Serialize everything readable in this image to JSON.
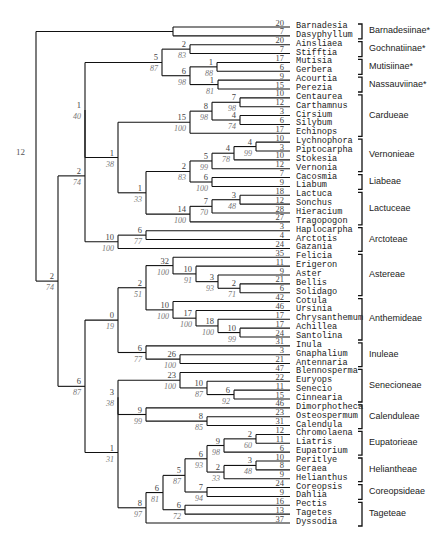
{
  "diagram": {
    "type": "cladogram",
    "root_label": "12",
    "leaves": [
      {
        "name": "Barnadesia",
        "len": "20"
      },
      {
        "name": "Dasyphyllum",
        "len": "7"
      },
      {
        "name": "Ainsliaea",
        "len": "20"
      },
      {
        "name": "Stifftia",
        "len": "7"
      },
      {
        "name": "Mutisia",
        "len": "17"
      },
      {
        "name": "Gerbera",
        "len": "6"
      },
      {
        "name": "Acourtia",
        "len": "9"
      },
      {
        "name": "Perezia",
        "len": "15"
      },
      {
        "name": "Centaurea",
        "len": "10"
      },
      {
        "name": "Carthamnus",
        "len": "12"
      },
      {
        "name": "Cirsium",
        "len": "3"
      },
      {
        "name": "Silybum",
        "len": "6"
      },
      {
        "name": "Echinops",
        "len": "17"
      },
      {
        "name": "Lychnophora",
        "len": "10"
      },
      {
        "name": "Piptocarpha",
        "len": "3"
      },
      {
        "name": "Stokesia",
        "len": "10"
      },
      {
        "name": "Vernonia",
        "len": "12"
      },
      {
        "name": "Cacosmia",
        "len": "7"
      },
      {
        "name": "Liabum",
        "len": "9"
      },
      {
        "name": "Lactuca",
        "len": "18"
      },
      {
        "name": "Sonchus",
        "len": "12"
      },
      {
        "name": "Hieracium",
        "len": "28"
      },
      {
        "name": "Tragopogon",
        "len": "27"
      },
      {
        "name": "Haplocarpha",
        "len": "3"
      },
      {
        "name": "Arctotis",
        "len": "4"
      },
      {
        "name": "Gazania",
        "len": "24"
      },
      {
        "name": "Felicia",
        "len": "35"
      },
      {
        "name": "Erigeron",
        "len": "11"
      },
      {
        "name": "Aster",
        "len": "9"
      },
      {
        "name": "Bellis",
        "len": "21"
      },
      {
        "name": "Solidago",
        "len": "6"
      },
      {
        "name": "Cotula",
        "len": "42"
      },
      {
        "name": "Ursinia",
        "len": "46"
      },
      {
        "name": "Chrysanthemum",
        "len": "17"
      },
      {
        "name": "Achillea",
        "len": "17"
      },
      {
        "name": "Santolina",
        "len": "24"
      },
      {
        "name": "Inula",
        "len": "31"
      },
      {
        "name": "Gnaphalium",
        "len": "3"
      },
      {
        "name": "Antennaria",
        "len": "21"
      },
      {
        "name": "Blennosperma",
        "len": "47"
      },
      {
        "name": "Euryops",
        "len": "22"
      },
      {
        "name": "Senecio",
        "len": "11"
      },
      {
        "name": "Cinnearia",
        "len": "15"
      },
      {
        "name": "Dimorphotheca",
        "len": "46"
      },
      {
        "name": "Osteospermum",
        "len": "23"
      },
      {
        "name": "Calendula",
        "len": "31"
      },
      {
        "name": "Chromolaena",
        "len": "12"
      },
      {
        "name": "Liatris",
        "len": "11"
      },
      {
        "name": "Eupatorium",
        "len": "6"
      },
      {
        "name": "Peritlye",
        "len": "10"
      },
      {
        "name": "Geraea",
        "len": "8"
      },
      {
        "name": "Helianthus",
        "len": "9"
      },
      {
        "name": "Coreopsis",
        "len": "24"
      },
      {
        "name": "Dahlia",
        "len": "9"
      },
      {
        "name": "Pectis",
        "len": "16"
      },
      {
        "name": "Tagetes",
        "len": "13"
      },
      {
        "name": "Dyssodia",
        "len": "37"
      }
    ],
    "tribes": [
      {
        "label": "Barnadesiinae*",
        "from": 0,
        "to": 1
      },
      {
        "label": "Gochnatiinae*",
        "from": 2,
        "to": 3
      },
      {
        "label": "Mutisiinae*",
        "from": 4,
        "to": 5
      },
      {
        "label": "Nassauviinae*",
        "from": 6,
        "to": 7
      },
      {
        "label": "Cardueae",
        "from": 8,
        "to": 12
      },
      {
        "label": "Vernonieae",
        "from": 13,
        "to": 16
      },
      {
        "label": "Liabeae",
        "from": 17,
        "to": 18
      },
      {
        "label": "Lactuceae",
        "from": 19,
        "to": 22
      },
      {
        "label": "Arctoteae",
        "from": 23,
        "to": 25
      },
      {
        "label": "Astereae",
        "from": 26,
        "to": 30
      },
      {
        "label": "Anthemideae",
        "from": 31,
        "to": 35
      },
      {
        "label": "Inuleae",
        "from": 36,
        "to": 38
      },
      {
        "label": "Senecioneae",
        "from": 39,
        "to": 42
      },
      {
        "label": "Calenduleae",
        "from": 43,
        "to": 45
      },
      {
        "label": "Eupatorieae",
        "from": 46,
        "to": 48
      },
      {
        "label": "Heliantheae",
        "from": 49,
        "to": 51
      },
      {
        "label": "Coreopsideae",
        "from": 52,
        "to": 53
      },
      {
        "label": "Tageteae",
        "from": 54,
        "to": 56
      }
    ],
    "nodes": [
      {
        "x": 173,
        "y": 31,
        "kids": [
          "L0",
          "L1"
        ]
      },
      {
        "x": 190,
        "y": 50,
        "kids": [
          "L2",
          "L3"
        ],
        "len": "2",
        "boot": "83"
      },
      {
        "x": 217,
        "y": 69,
        "kids": [
          "L4",
          "L5"
        ],
        "len": "1",
        "boot": "88"
      },
      {
        "x": 218,
        "y": 87,
        "kids": [
          "L6",
          "L7"
        ],
        "len": "1",
        "boot": "81"
      },
      {
        "x": 190,
        "y": 78,
        "kids": [
          "N2",
          "N3"
        ],
        "len": "6",
        "boot": "98"
      },
      {
        "x": 162,
        "y": 64,
        "kids": [
          "N1",
          "N4"
        ],
        "len": "5",
        "boot": "87"
      },
      {
        "x": 240,
        "y": 105,
        "kids": [
          "L8",
          "L9"
        ],
        "len": "7",
        "boot": "98"
      },
      {
        "x": 240,
        "y": 122,
        "kids": [
          "L10",
          "L11"
        ],
        "len": "4",
        "boot": "74"
      },
      {
        "x": 212,
        "y": 114,
        "kids": [
          "N6",
          "N7"
        ],
        "len": "8",
        "boot": "98"
      },
      {
        "x": 190,
        "y": 125,
        "kids": [
          "N8",
          "L12"
        ],
        "len": "15",
        "boot": "100"
      },
      {
        "x": 256,
        "y": 150,
        "kids": [
          "L13",
          "L14"
        ],
        "len": "4",
        "boot": "99"
      },
      {
        "x": 234,
        "y": 154,
        "kids": [
          "N10",
          "L15"
        ],
        "len": "4",
        "boot": "78"
      },
      {
        "x": 212,
        "y": 163,
        "kids": [
          "N11",
          "L16"
        ],
        "len": "5",
        "boot": "99"
      },
      {
        "x": 212,
        "y": 185,
        "kids": [
          "L17",
          "L18"
        ],
        "len": "6",
        "boot": "100"
      },
      {
        "x": 190,
        "y": 174,
        "kids": [
          "N12",
          "N13"
        ],
        "len": "2",
        "boot": "83"
      },
      {
        "x": 240,
        "y": 207,
        "kids": [
          "L19",
          "L20"
        ],
        "len": "3",
        "boot": "48"
      },
      {
        "x": 212,
        "y": 212,
        "kids": [
          "N15",
          "L21"
        ],
        "len": "7",
        "boot": "70"
      },
      {
        "x": 190,
        "y": 218,
        "kids": [
          "N16",
          "L22"
        ],
        "len": "14",
        "boot": "100"
      },
      {
        "x": 146,
        "y": 196,
        "kids": [
          "N14",
          "N17"
        ],
        "len": "1",
        "boot": "33"
      },
      {
        "x": 118,
        "y": 160,
        "kids": [
          "N9",
          "N18"
        ],
        "len": "1",
        "boot": "38"
      },
      {
        "x": 85,
        "y": 107,
        "kids": [
          "N5",
          "N19"
        ],
        "len": "1",
        "boot": "40"
      },
      {
        "x": 146,
        "y": 238,
        "kids": [
          "L23",
          "L24"
        ],
        "len": "6",
        "boot": "77"
      },
      {
        "x": 118,
        "y": 244,
        "kids": [
          "N21",
          "L25"
        ],
        "len": "10",
        "boot": "100"
      },
      {
        "x": 85,
        "y": 175,
        "kids": [
          "N20",
          "N22"
        ],
        "len": "2",
        "boot": "74"
      },
      {
        "x": 240,
        "y": 291,
        "kids": [
          "L29",
          "L30"
        ],
        "len": "2",
        "boot": "71"
      },
      {
        "x": 218,
        "y": 284,
        "kids": [
          "L28",
          "N24"
        ],
        "len": "3",
        "boot": "93"
      },
      {
        "x": 196,
        "y": 276,
        "kids": [
          "L27",
          "N25"
        ],
        "len": "10",
        "boot": "91"
      },
      {
        "x": 173,
        "y": 268,
        "kids": [
          "L26",
          "N26"
        ],
        "len": "32",
        "boot": "100"
      },
      {
        "x": 240,
        "y": 335,
        "kids": [
          "L34",
          "L35"
        ],
        "len": "10",
        "boot": "99"
      },
      {
        "x": 218,
        "y": 328,
        "kids": [
          "L33",
          "N28"
        ],
        "len": "18",
        "boot": "100"
      },
      {
        "x": 196,
        "y": 320,
        "kids": [
          "L32",
          "N29"
        ],
        "len": "17",
        "boot": "100"
      },
      {
        "x": 173,
        "y": 312,
        "kids": [
          "L31",
          "N30"
        ],
        "len": "10",
        "boot": "100"
      },
      {
        "x": 146,
        "y": 290,
        "kids": [
          "N27",
          "N31"
        ],
        "len": "2",
        "boot": "51"
      },
      {
        "x": 180,
        "y": 361,
        "kids": [
          "L37",
          "L38"
        ],
        "len": "26",
        "boot": "100"
      },
      {
        "x": 146,
        "y": 354,
        "kids": [
          "L36",
          "N33"
        ],
        "len": "6",
        "boot": "77"
      },
      {
        "x": 118,
        "y": 322,
        "kids": [
          "N32",
          "N34"
        ],
        "len": "0",
        "boot": "19"
      },
      {
        "x": 234,
        "y": 396,
        "kids": [
          "L41",
          "L42"
        ],
        "len": "6",
        "boot": "92"
      },
      {
        "x": 207,
        "y": 389,
        "kids": [
          "L40",
          "N36"
        ],
        "len": "10",
        "boot": "87"
      },
      {
        "x": 180,
        "y": 381,
        "kids": [
          "L39",
          "N37"
        ],
        "len": "23",
        "boot": "100"
      },
      {
        "x": 207,
        "y": 422,
        "kids": [
          "L44",
          "L45"
        ],
        "len": "8",
        "boot": "85"
      },
      {
        "x": 146,
        "y": 416,
        "kids": [
          "L43",
          "N39"
        ],
        "len": "9",
        "boot": "99"
      },
      {
        "x": 118,
        "y": 398,
        "kids": [
          "N38",
          "N40"
        ],
        "len": "3",
        "boot": "38"
      },
      {
        "x": 256,
        "y": 440,
        "kids": [
          "L46",
          "L47"
        ],
        "len": "2",
        "boot": "60"
      },
      {
        "x": 224,
        "y": 446,
        "kids": [
          "N42",
          "L48"
        ],
        "len": "9",
        "boot": "98"
      },
      {
        "x": 256,
        "y": 466,
        "kids": [
          "L49",
          "L50"
        ],
        "len": "3",
        "boot": "48"
      },
      {
        "x": 224,
        "y": 472,
        "kids": [
          "N44",
          "L51"
        ],
        "len": "2",
        "boot": "33"
      },
      {
        "x": 207,
        "y": 459,
        "kids": [
          "N43",
          "N45"
        ],
        "len": "6",
        "boot": "93"
      },
      {
        "x": 207,
        "y": 492,
        "kids": [
          "L52",
          "L53"
        ],
        "len": "7",
        "boot": "94"
      },
      {
        "x": 185,
        "y": 475,
        "kids": [
          "N46",
          "N47"
        ],
        "len": "5",
        "boot": "87"
      },
      {
        "x": 185,
        "y": 509,
        "kids": [
          "L54",
          "L55"
        ],
        "len": "6",
        "boot": "72"
      },
      {
        "x": 163,
        "y": 492,
        "kids": [
          "N48",
          "N49"
        ],
        "len": "6",
        "boot": "81"
      },
      {
        "x": 146,
        "y": 507,
        "kids": [
          "N50",
          "L56"
        ],
        "len": "8",
        "boot": "97"
      },
      {
        "x": 118,
        "y": 460,
        "kids": [
          "N41",
          "N51"
        ],
        "len": "1",
        "boot": "31"
      },
      {
        "x": 85,
        "y": 391,
        "kids": [
          "N35",
          "N52"
        ],
        "len": "6",
        "boot": "87"
      },
      {
        "x": 58,
        "y": 283,
        "kids": [
          "N23",
          "N53"
        ],
        "len": "2",
        "boot": "74"
      },
      {
        "x": 36,
        "y": 157,
        "kids": [
          "N0",
          "N54"
        ]
      }
    ]
  }
}
